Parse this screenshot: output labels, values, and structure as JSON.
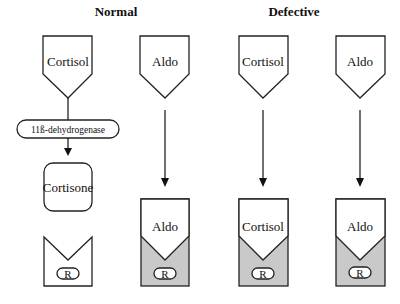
{
  "headers": {
    "normal": "Normal",
    "defective": "Defective"
  },
  "columns": [
    {
      "hormone": "Cortisol",
      "enzyme": "11ß-dehydrogenase",
      "product": "Cortisone",
      "receptor_bound": null,
      "receptor": "R"
    },
    {
      "hormone": "Aldo",
      "receptor_bound": "Aldo",
      "receptor": "R"
    },
    {
      "hormone": "Cortisol",
      "receptor_bound": "Cortisol",
      "receptor": "R"
    },
    {
      "hormone": "Aldo",
      "receptor_bound": "Aldo",
      "receptor": "R"
    }
  ],
  "colors": {
    "stroke": "#222222",
    "shade": "#c9c9c9"
  }
}
